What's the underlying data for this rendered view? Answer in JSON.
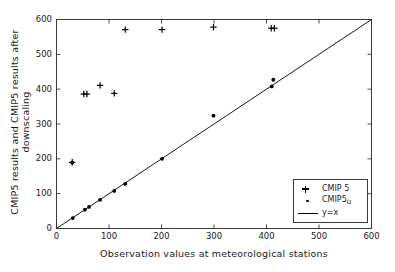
{
  "chart_data": {
    "type": "scatter",
    "title": "",
    "xlabel": "Observation values at meteorological stations",
    "ylabel": "CMIP5 results and CMIP5 results after downscaling",
    "xlim": [
      0,
      600
    ],
    "ylim": [
      0,
      600
    ],
    "xticks": [
      0,
      100,
      200,
      300,
      400,
      500,
      600
    ],
    "yticks": [
      0,
      100,
      200,
      300,
      400,
      500,
      600
    ],
    "grid": false,
    "legend_position": "lower right",
    "series": [
      {
        "name": "CMIP 5",
        "marker": "plus",
        "color": "#000000",
        "points": [
          [
            30,
            190
          ],
          [
            52,
            386
          ],
          [
            58,
            386
          ],
          [
            83,
            411
          ],
          [
            110,
            388
          ],
          [
            131,
            571
          ],
          [
            201,
            571
          ],
          [
            299,
            578
          ],
          [
            409,
            575
          ],
          [
            415,
            575
          ]
        ]
      },
      {
        "name": "CMIP5_D",
        "marker": "dot",
        "color": "#000000",
        "points": [
          [
            30,
            189
          ],
          [
            31,
            30
          ],
          [
            54,
            54
          ],
          [
            62,
            62
          ],
          [
            83,
            82
          ],
          [
            110,
            108
          ],
          [
            131,
            128
          ],
          [
            201,
            200
          ],
          [
            299,
            324
          ],
          [
            410,
            408
          ],
          [
            413,
            427
          ]
        ]
      }
    ],
    "reference_line": {
      "name": "y=x",
      "slope": 1,
      "intercept": 0,
      "color": "#000000"
    }
  },
  "axes": {
    "xticklabels": [
      "0",
      "100",
      "200",
      "300",
      "400",
      "500",
      "600"
    ],
    "yticklabels": [
      "0",
      "100",
      "200",
      "300",
      "400",
      "500",
      "600"
    ]
  },
  "legend": {
    "entries": [
      {
        "label": "CMIP 5",
        "key": "plus-marker",
        "sub": ""
      },
      {
        "label": "CMIP5",
        "key": "dot-marker",
        "sub": "D"
      },
      {
        "label": "y=x",
        "key": "line-swatch",
        "sub": ""
      }
    ]
  }
}
